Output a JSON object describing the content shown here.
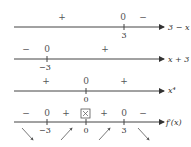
{
  "rows": [
    {
      "label": "3 − x",
      "signs": [
        {
          "t": "+",
          "x": 62
        },
        {
          "t": "0",
          "x": 123
        },
        {
          "t": "−",
          "x": 143
        }
      ],
      "ticks": [
        {
          "x": 124,
          "label": "3"
        }
      ]
    },
    {
      "label": "x + 3",
      "signs": [
        {
          "t": "−",
          "x": 26
        },
        {
          "t": "0",
          "x": 47
        },
        {
          "t": "+",
          "x": 105
        }
      ],
      "ticks": [
        {
          "x": 47,
          "label": "−3"
        }
      ]
    },
    {
      "label": "x⁴",
      "signs": [
        {
          "t": "+",
          "x": 46
        },
        {
          "t": "0",
          "x": 86
        },
        {
          "t": "+",
          "x": 124
        }
      ],
      "ticks": [
        {
          "x": 86,
          "label": "0"
        }
      ]
    },
    {
      "label": "f′(x)",
      "signs": [
        {
          "t": "−",
          "x": 26
        },
        {
          "t": "0",
          "x": 47
        },
        {
          "t": "+",
          "x": 66
        },
        {
          "t": "⊠",
          "x": 86
        },
        {
          "t": "+",
          "x": 104
        },
        {
          "t": "0",
          "x": 124
        },
        {
          "t": "−",
          "x": 143
        }
      ],
      "ticks": [
        {
          "x": 47,
          "label": "−3"
        },
        {
          "x": 86,
          "label": "0"
        },
        {
          "x": 124,
          "label": "3"
        }
      ],
      "arrows": [
        "down",
        "up",
        "up",
        "down"
      ]
    }
  ]
}
